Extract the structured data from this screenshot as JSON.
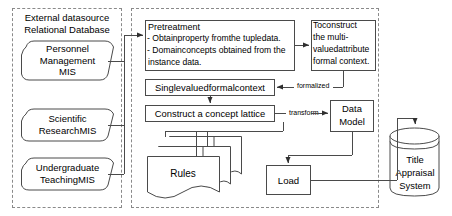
{
  "diagram": {
    "groups": {
      "external": {
        "header_line1": "External datasource",
        "header_line2": "Relational Database"
      },
      "process": {
        "name": "processing-region"
      }
    },
    "sources": [
      {
        "id": "personnel",
        "lines": [
          "Personnel",
          "Management",
          "MIS"
        ]
      },
      {
        "id": "scientific",
        "lines": [
          "Scientific",
          "ResearchMIS"
        ]
      },
      {
        "id": "undergraduate",
        "lines": [
          "Undergraduate",
          "TeachingMIS"
        ]
      }
    ],
    "pretreatment": {
      "line1": "Pretreatment",
      "line2": "- Obtainproperty fromthe tupledata.",
      "line3": "- Domainconcepts obtained from the",
      "line4": "instance data."
    },
    "multivalued": {
      "line1": "Toconstruct",
      "line2": "the multi-",
      "line3": "valuedattribute",
      "line4": "formal context."
    },
    "single_valued": {
      "label": "Singlevaluedformalcontext"
    },
    "lattice": {
      "label": "Construct a  concept lattice"
    },
    "data_model": {
      "line1": "Data",
      "line2": "Model"
    },
    "rules": {
      "label": "Rules"
    },
    "load": {
      "label": "Load"
    },
    "target_system": {
      "line1": "Title",
      "line2": "Appraisal",
      "line3": "System"
    },
    "edge_labels": {
      "formalized": "formalized",
      "transform": "transform"
    },
    "colors": {
      "stroke": "#4a4a4a",
      "dashed_border": "#8a8a8a",
      "background": "#ffffff",
      "text": "#000000"
    }
  }
}
